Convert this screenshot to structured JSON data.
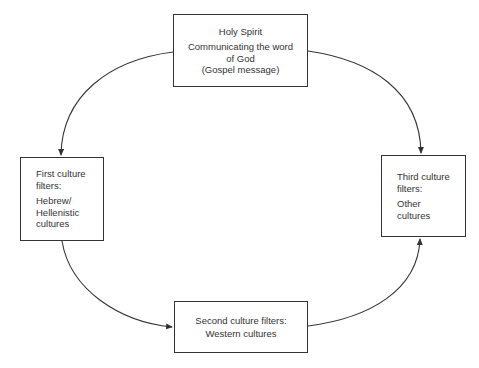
{
  "diagram": {
    "type": "cycle",
    "nodes": {
      "top": {
        "title": "Holy Spirit",
        "lines": [
          "Communicating the word",
          "of God",
          "(Gospel message)"
        ]
      },
      "left": {
        "heading_lines": [
          "First culture",
          "filters:"
        ],
        "body_lines": [
          "Hebrew/",
          "Hellenistic",
          "cultures"
        ]
      },
      "bottom": {
        "heading": "Second culture filters:",
        "body": "Western cultures"
      },
      "right": {
        "heading_lines": [
          "Third culture",
          "filters:"
        ],
        "body_lines": [
          "Other",
          "cultures"
        ]
      }
    },
    "edges": [
      {
        "from": "top",
        "to": "left"
      },
      {
        "from": "top",
        "to": "right"
      },
      {
        "from": "left",
        "to": "bottom"
      },
      {
        "from": "bottom",
        "to": "right"
      }
    ],
    "colors": {
      "line": "#333333",
      "background": "#ffffff"
    }
  }
}
